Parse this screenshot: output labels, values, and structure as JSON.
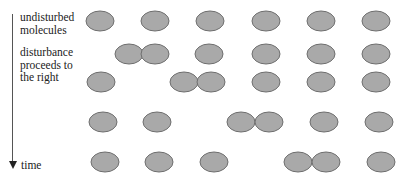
{
  "labels": {
    "undisturbed": [
      "undisturbed",
      "molecules"
    ],
    "disturbance": [
      "disturbance",
      "proceeds to",
      "the right"
    ],
    "time": "time"
  },
  "molecule_style": {
    "fill": "#a9a9a9",
    "stroke": "#6e6e6e",
    "rx": 14,
    "ry": 10
  },
  "rows": [
    {
      "y": 21,
      "x": [
        100,
        155,
        210,
        266,
        321,
        376
      ]
    },
    {
      "y": 54,
      "x": [
        129,
        155,
        209,
        266,
        321,
        376
      ]
    },
    {
      "y": 82,
      "x": [
        101,
        184,
        211,
        266,
        321,
        376
      ]
    },
    {
      "y": 122,
      "x": [
        103,
        157,
        241,
        269,
        324,
        379
      ]
    },
    {
      "y": 162,
      "x": [
        105,
        159,
        214,
        298,
        326,
        381
      ]
    }
  ]
}
